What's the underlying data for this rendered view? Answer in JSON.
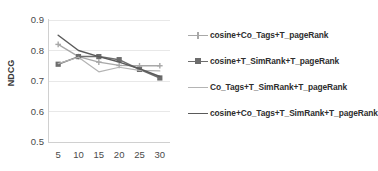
{
  "chart_data": {
    "type": "line",
    "title": "",
    "xlabel": "",
    "ylabel": "NDCG",
    "x": [
      5,
      10,
      15,
      20,
      25,
      30
    ],
    "xticklabels": [
      "5",
      "10",
      "15",
      "20",
      "25",
      "30"
    ],
    "yticklabels": [
      "0.5",
      "0.6",
      "0.7",
      "0.8",
      "0.9"
    ],
    "yticks": [
      0.5,
      0.6,
      0.7,
      0.8,
      0.9
    ],
    "ylim": [
      0.5,
      0.9
    ],
    "xlim": [
      2.5,
      32.5
    ],
    "grid": true,
    "legend_position": "right",
    "series": [
      {
        "name": "cosine+Co_Tags+T_pageRank",
        "values": [
          0.82,
          0.78,
          0.762,
          0.751,
          0.75,
          0.75
        ],
        "color": "#a8a8a8",
        "marker": "cross",
        "width": 1.3
      },
      {
        "name": "cosine+T_SimRank+T_pageRank",
        "values": [
          0.755,
          0.78,
          0.78,
          0.77,
          0.738,
          0.71
        ],
        "color": "#6d6d6d",
        "marker": "square",
        "width": 1.5
      },
      {
        "name": "Co_Tags+T_SimRank+T_pageRank",
        "values": [
          0.757,
          0.778,
          0.73,
          0.745,
          0.735,
          0.733
        ],
        "color": "#b4b4b4",
        "marker": "none",
        "width": 1.2
      },
      {
        "name": "cosine+Co_Tags+T_SimRank+T_pageRank",
        "values": [
          0.85,
          0.8,
          0.78,
          0.762,
          0.74,
          0.715
        ],
        "color": "#5a5a5a",
        "marker": "none",
        "width": 1.5
      }
    ]
  },
  "legend": {
    "entries": [
      {
        "label": "cosine+Co_Tags+T_pageRank"
      },
      {
        "label": "cosine+T_SimRank+T_pageRank"
      },
      {
        "label": "Co_Tags+T_SimRank+T_pageRank"
      },
      {
        "label": "cosine+Co_Tags+T_SimRank+T_pageRank"
      }
    ]
  },
  "axes": {
    "y_title": "NDCG"
  },
  "colors": {
    "gridline": "#e8e8e8",
    "axis": "#d0d0d0",
    "tick_text": "#4a4a4a",
    "legend_text": "#2e2e2e",
    "plot_background": "#ffffff"
  }
}
